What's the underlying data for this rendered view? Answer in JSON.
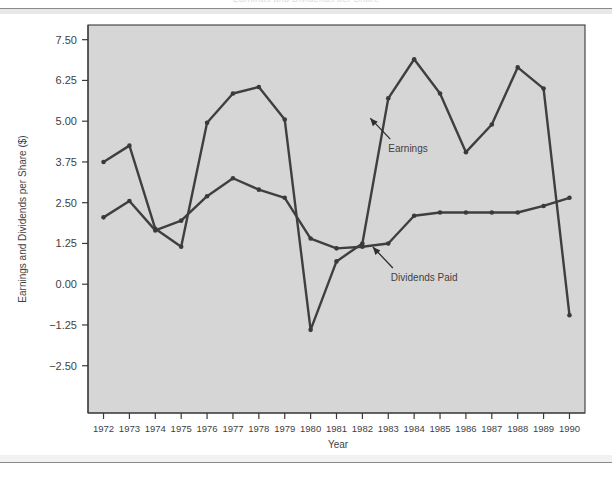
{
  "figure": {
    "clipped_title": "Earnings and Dividends per Share",
    "ylabel": "Earnings and Dividends per Share ($)",
    "xlabel": "Year"
  },
  "annotations": [
    {
      "name": "earnings",
      "label": "Earnings",
      "x": 1983.0,
      "y": 4.05
    },
    {
      "name": "dividends-paid",
      "label": "Dividends Paid",
      "x": 1983.1,
      "y": 0.1
    }
  ],
  "chart_data": {
    "type": "line",
    "title": "Earnings and Dividends per Share",
    "xlabel": "Year",
    "ylabel": "Earnings and Dividends per Share ($)",
    "xlim": [
      1971.4,
      1990.6
    ],
    "ylim": [
      -3.95,
      7.95
    ],
    "grid": false,
    "legend_position": "none (inline annotated labels)",
    "x": [
      1972,
      1973,
      1974,
      1975,
      1976,
      1977,
      1978,
      1979,
      1980,
      1981,
      1982,
      1983,
      1984,
      1985,
      1986,
      1987,
      1988,
      1989,
      1990
    ],
    "categories": [
      "1972",
      "1973",
      "1974",
      "1975",
      "1976",
      "1977",
      "1978",
      "1979",
      "1980",
      "1981",
      "1982",
      "1983",
      "1984",
      "1985",
      "1986",
      "1987",
      "1988",
      "1989",
      "1990"
    ],
    "yticks": [
      7.5,
      6.25,
      5.0,
      3.75,
      2.5,
      1.25,
      0.0,
      -1.25,
      -2.5
    ],
    "ytick_labels": [
      "7.50",
      "6.25",
      "5.00",
      "3.75",
      "2.50",
      "1.25",
      "0.00",
      "−1.25",
      "−2.50"
    ],
    "series": [
      {
        "name": "Earnings",
        "values": [
          3.75,
          4.25,
          1.7,
          1.15,
          4.95,
          5.85,
          6.05,
          5.05,
          -1.4,
          0.7,
          1.25,
          5.7,
          6.9,
          5.85,
          4.05,
          4.9,
          6.65,
          6.0,
          -0.95
        ]
      },
      {
        "name": "Dividends Paid",
        "values": [
          2.05,
          2.55,
          1.65,
          1.95,
          2.7,
          3.25,
          2.9,
          2.65,
          1.4,
          1.1,
          1.15,
          1.25,
          2.1,
          2.2,
          2.2,
          2.2,
          2.2,
          2.4,
          2.65
        ]
      }
    ]
  },
  "colors": {
    "panel": "#d6d6d6",
    "line": "#3f3f3f",
    "text": "#3f3f3f",
    "page": "#ffffff"
  }
}
